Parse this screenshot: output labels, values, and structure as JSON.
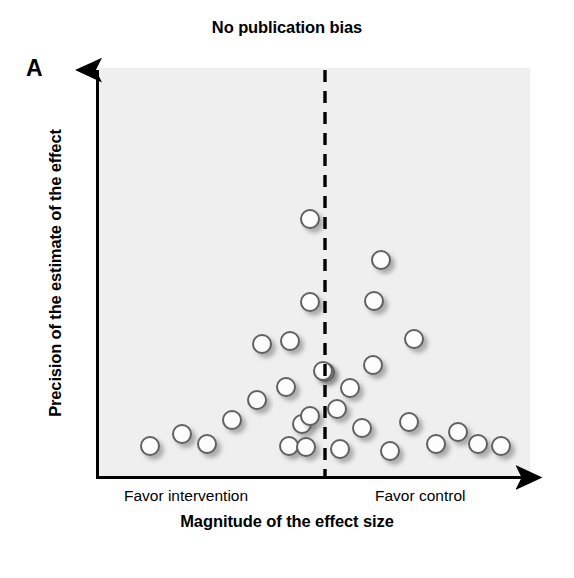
{
  "figure": {
    "panel_label": "A",
    "title": "No publication bias",
    "xlabel": "Magnitude of the effect size",
    "ylabel": "Precision of the estimate of the effect",
    "left_side_label": "Favor intervention",
    "right_side_label": "Favor control",
    "colors": {
      "panel_background": "#efefef",
      "axis": "#000000",
      "marker_fill": "#fdfdfd",
      "marker_stroke": "#616161",
      "reference_line": "#000000"
    }
  },
  "chart_data": {
    "type": "scatter",
    "title": "No publication bias",
    "subtitle": "",
    "xlabel": "Magnitude of the effect size",
    "ylabel": "Precision of the estimate of the effect",
    "xlabel_left_annotation": "Favor intervention",
    "xlabel_right_annotation": "Favor control",
    "axis_ticks": false,
    "grid": false,
    "legend": "none",
    "xlim": [
      0,
      100
    ],
    "ylim": [
      0,
      100
    ],
    "reference_line": {
      "orientation": "vertical",
      "x": 52.7,
      "style": "dashed",
      "label": "no effect"
    },
    "marker": {
      "shape": "circle",
      "fill": "#fdfdfd",
      "stroke": "#616161",
      "size_px": 20,
      "shadow": true
    },
    "series": [
      {
        "name": "studies",
        "n_points": 30,
        "description": "Symmetric inverted-funnel scatter of study effect estimates; high-precision studies cluster near the no-effect line at the top, low-precision studies spread symmetrically at the bottom.",
        "points": [
          {
            "x": 12.2,
            "y": 7.8
          },
          {
            "x": 19.6,
            "y": 10.7
          },
          {
            "x": 25.4,
            "y": 8.3
          },
          {
            "x": 31.2,
            "y": 13.9
          },
          {
            "x": 37.0,
            "y": 18.5
          },
          {
            "x": 38.2,
            "y": 32.2
          },
          {
            "x": 43.8,
            "y": 21.5
          },
          {
            "x": 44.5,
            "y": 8.0
          },
          {
            "x": 47.5,
            "y": 13.2
          },
          {
            "x": 48.4,
            "y": 7.6
          },
          {
            "x": 44.6,
            "y": 40.7
          },
          {
            "x": 52.7,
            "y": 33.4
          },
          {
            "x": 49.2,
            "y": 47.8
          },
          {
            "x": 52.3,
            "y": 58.5
          },
          {
            "x": 49.2,
            "y": 63.2
          },
          {
            "x": 57.5,
            "y": 21.3
          },
          {
            "x": 54.5,
            "y": 16.4
          },
          {
            "x": 55.3,
            "y": 6.8
          },
          {
            "x": 60.5,
            "y": 11.8
          },
          {
            "x": 63.1,
            "y": 27.2
          },
          {
            "x": 67.2,
            "y": 7.2
          },
          {
            "x": 71.6,
            "y": 14.1
          },
          {
            "x": 72.9,
            "y": 33.3
          },
          {
            "x": 78.0,
            "y": 8.2
          },
          {
            "x": 83.1,
            "y": 11.0
          },
          {
            "x": 87.8,
            "y": 8.4
          },
          {
            "x": 93.1,
            "y": 8.0
          },
          {
            "x": 58.5,
            "y": 43.8
          },
          {
            "x": 60.2,
            "y": 53.3
          },
          {
            "x": 49.2,
            "y": 76.4
          }
        ]
      }
    ]
  },
  "points_px": [
    {
      "left": 140,
      "top": 436
    },
    {
      "left": 172,
      "top": 424
    },
    {
      "left": 197,
      "top": 434
    },
    {
      "left": 222,
      "top": 410
    },
    {
      "left": 247,
      "top": 390
    },
    {
      "left": 252,
      "top": 334
    },
    {
      "left": 276,
      "top": 377
    },
    {
      "left": 279,
      "top": 436
    },
    {
      "left": 292,
      "top": 414
    },
    {
      "left": 296,
      "top": 437
    },
    {
      "left": 280,
      "top": 331
    },
    {
      "left": 315,
      "top": 362
    },
    {
      "left": 300,
      "top": 406
    },
    {
      "left": 313,
      "top": 361
    },
    {
      "left": 300,
      "top": 292
    },
    {
      "left": 340,
      "top": 378
    },
    {
      "left": 327,
      "top": 399
    },
    {
      "left": 330,
      "top": 439
    },
    {
      "left": 352,
      "top": 418
    },
    {
      "left": 363,
      "top": 355
    },
    {
      "left": 380,
      "top": 441
    },
    {
      "left": 399,
      "top": 412
    },
    {
      "left": 404,
      "top": 329
    },
    {
      "left": 426,
      "top": 434
    },
    {
      "left": 448,
      "top": 422
    },
    {
      "left": 468,
      "top": 434
    },
    {
      "left": 491,
      "top": 436
    },
    {
      "left": 364,
      "top": 291
    },
    {
      "left": 371,
      "top": 250
    },
    {
      "left": 300,
      "top": 209
    }
  ]
}
